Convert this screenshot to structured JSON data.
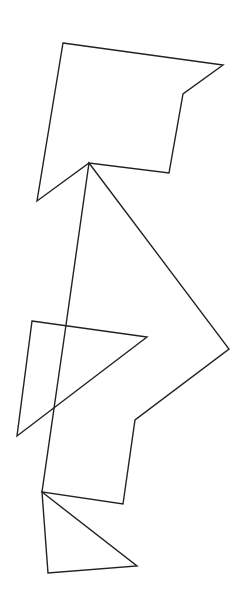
{
  "figure": {
    "width": 241,
    "height": 595,
    "background": "#ffffff",
    "stroke_color": "#222222",
    "stroke_width": 1.4,
    "shapes": [
      {
        "name": "top-pentagon-shape",
        "type": "polygon",
        "points": "63,43 223,65 183,94 169,173 89,163 37,201"
      },
      {
        "name": "long-quadrilateral-shape",
        "type": "polygon",
        "points": "89,163 229,349 135,420 123,504 42,492 66,325"
      },
      {
        "name": "middle-triangle",
        "type": "polygon",
        "points": "32,321 147,337 17,436"
      },
      {
        "name": "bottom-triangle",
        "type": "polygon",
        "points": "42,492 137,566 48,573"
      }
    ]
  }
}
